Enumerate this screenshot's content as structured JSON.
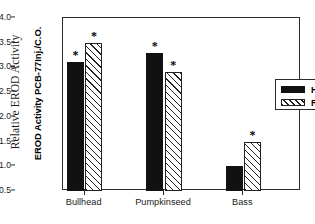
{
  "chart_data": {
    "type": "bar",
    "title": "",
    "xlabel": "",
    "ylabel": "Relative EROD Activity",
    "ylabel_secondary": "EROD Activity PCB-77Inj./C.O.",
    "categories": [
      "Bullhead",
      "Pumpkinseed",
      "Bass"
    ],
    "series": [
      {
        "name": "HR",
        "values": [
          3.1,
          3.3,
          1.0
        ],
        "fill": "solid-black",
        "color": "#111111"
      },
      {
        "name": "REF",
        "values": [
          3.5,
          2.9,
          1.5
        ],
        "fill": "forward-hatch",
        "color": "#222222"
      }
    ],
    "significance_markers": {
      "symbol": "*",
      "HR": [
        true,
        true,
        false
      ],
      "REF": [
        true,
        true,
        true
      ]
    },
    "ylim": [
      0.5,
      4.0
    ],
    "baseline": 0.5,
    "ytick_values": [
      "0.5",
      "1.0",
      "1.5",
      "2.0",
      "2.5",
      "3.0",
      "3.5",
      "4.0"
    ],
    "grid": false,
    "legend_position": "upper-right-inside",
    "frame": "box"
  },
  "legend": {
    "entries": [
      {
        "label": "HR"
      },
      {
        "label": "REF"
      }
    ]
  },
  "axis": {
    "y_title_outer": "Relative EROD Activity",
    "y_title_inner": "EROD Activity PCB-77Inj./C.O."
  }
}
